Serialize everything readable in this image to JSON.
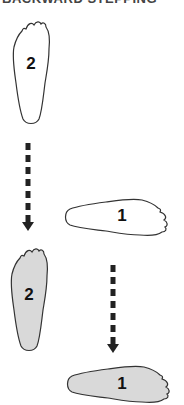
{
  "title": "BACKWARD STEPPING",
  "colors": {
    "outline": "#333333",
    "filled_foot": "#d9d9d9",
    "empty_foot": "#ffffff",
    "arrow": "#222222"
  },
  "steps": [
    {
      "id": "foot-2-start",
      "label": "2",
      "state": "start",
      "orientation": "vertical"
    },
    {
      "id": "foot-1-start",
      "label": "1",
      "state": "start",
      "orientation": "horizontal"
    },
    {
      "id": "foot-2-end",
      "label": "2",
      "state": "end",
      "orientation": "vertical"
    },
    {
      "id": "foot-1-end",
      "label": "1",
      "state": "end",
      "orientation": "horizontal"
    }
  ],
  "arrows": [
    {
      "id": "arrow-foot-2",
      "from": "foot-2-start",
      "to": "foot-2-end",
      "style": "dashed",
      "direction": "down"
    },
    {
      "id": "arrow-foot-1",
      "from": "foot-1-start",
      "to": "foot-1-end",
      "style": "dashed",
      "direction": "down"
    }
  ]
}
